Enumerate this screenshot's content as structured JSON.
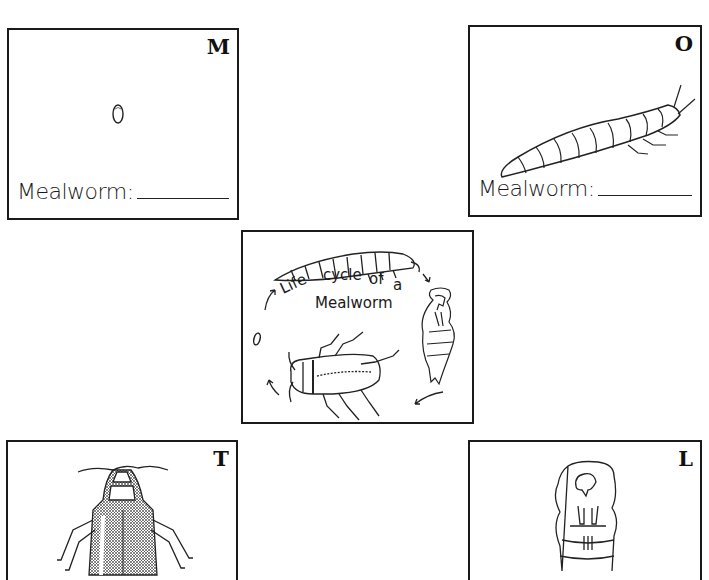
{
  "worksheet": {
    "cards": [
      {
        "id": "egg",
        "letter": "M",
        "label": "Mealworm:",
        "illustration": "egg-icon"
      },
      {
        "id": "larva",
        "letter": "O",
        "label": "Mealworm:",
        "illustration": "larva-icon"
      },
      {
        "id": "beetle",
        "letter": "T",
        "label": "",
        "illustration": "beetle-icon"
      },
      {
        "id": "pupa",
        "letter": "L",
        "label": "",
        "illustration": "pupa-icon"
      }
    ],
    "center": {
      "title_line1_a": "Life",
      "title_line1_b": "cycle",
      "title_line1_c": "of",
      "title_line1_d": "a",
      "title_line2": "Mealworm"
    }
  }
}
